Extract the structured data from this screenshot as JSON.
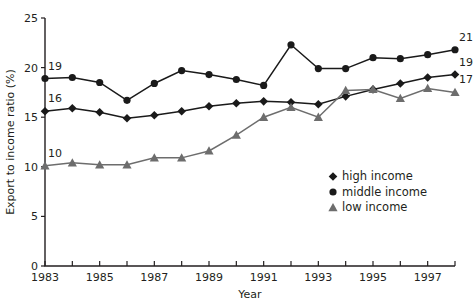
{
  "chart_data": {
    "type": "line",
    "title": "",
    "xlabel": "Year",
    "ylabel": "Export to income ratio (%)",
    "xlim": [
      1983,
      1998
    ],
    "ylim": [
      0,
      25
    ],
    "yticks": [
      0,
      5,
      10,
      15,
      20,
      25
    ],
    "ytick_labels": [
      "0",
      "5",
      "10",
      "15",
      "20",
      "25"
    ],
    "xticks": [
      1983,
      1984,
      1985,
      1986,
      1987,
      1988,
      1989,
      1990,
      1991,
      1992,
      1993,
      1994,
      1995,
      1996,
      1997,
      1998
    ],
    "xtick_labels": [
      "1983",
      "",
      "1985",
      "",
      "1987",
      "",
      "1989",
      "",
      "1991",
      "",
      "1993",
      "",
      "1995",
      "",
      "1997",
      ""
    ],
    "grid": false,
    "legend_position": "center-right",
    "x": [
      1983,
      1984,
      1985,
      1986,
      1987,
      1988,
      1989,
      1990,
      1991,
      1992,
      1993,
      1994,
      1995,
      1996,
      1997,
      1998
    ],
    "series": [
      {
        "name": "high income",
        "marker": "diamond",
        "color": "#1a1a1a",
        "values": [
          15.6,
          15.9,
          15.5,
          14.9,
          15.2,
          15.6,
          16.1,
          16.4,
          16.6,
          16.5,
          16.3,
          17.1,
          17.8,
          18.4,
          19.0,
          19.3
        ]
      },
      {
        "name": "middle income",
        "marker": "circle",
        "color": "#1a1a1a",
        "values": [
          18.9,
          19.0,
          18.5,
          16.7,
          18.4,
          19.7,
          19.3,
          18.8,
          18.2,
          22.3,
          19.9,
          19.9,
          21.0,
          20.9,
          21.3,
          21.8
        ]
      },
      {
        "name": "low income",
        "marker": "triangle",
        "color": "#6d6d6d",
        "values": [
          10.1,
          10.4,
          10.2,
          10.2,
          10.9,
          10.9,
          11.6,
          13.2,
          15.0,
          16.0,
          15.0,
          17.7,
          17.8,
          16.9,
          17.9,
          17.5
        ]
      }
    ],
    "point_labels": [
      {
        "series": "high income",
        "x": 1983,
        "text": "16"
      },
      {
        "series": "middle income",
        "x": 1983,
        "text": "19"
      },
      {
        "series": "low income",
        "x": 1983,
        "text": "10"
      },
      {
        "series": "high income",
        "x": 1998,
        "text": "19"
      },
      {
        "series": "middle income",
        "x": 1998,
        "text": "21"
      },
      {
        "series": "low income",
        "x": 1998,
        "text": "17"
      }
    ],
    "legend": [
      {
        "label": "high income",
        "marker": "diamond",
        "color": "#1a1a1a"
      },
      {
        "label": "middle income",
        "marker": "circle",
        "color": "#1a1a1a"
      },
      {
        "label": "low income",
        "marker": "triangle",
        "color": "#6d6d6d"
      }
    ]
  }
}
